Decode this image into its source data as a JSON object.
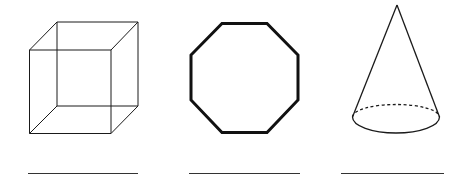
{
  "worksheet": {
    "shapes": [
      {
        "name": "cube",
        "kind": "3d-solid",
        "answer_line": ""
      },
      {
        "name": "octagon",
        "kind": "2d-polygon",
        "answer_line": ""
      },
      {
        "name": "cone",
        "kind": "3d-solid",
        "answer_line": ""
      }
    ],
    "colors": {
      "stroke": "#1a1a1a",
      "background": "#ffffff",
      "answer_line": "#333333"
    }
  }
}
